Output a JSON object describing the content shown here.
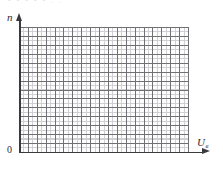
{
  "figure": {
    "title_fragment": "- - -  - -  . .",
    "background_color": "#ffffff",
    "axis_color": "#3a3a3e",
    "grid_major_color": "#6f6f74",
    "grid_minor_color": "#cfcfd4"
  },
  "axes": {
    "y_label": "n",
    "x_label": "U",
    "x_label_subscript": "в",
    "origin_label": "0",
    "y_arrow": "arrow-up",
    "x_arrow": "arrow-right"
  },
  "chart_data": {
    "type": "line",
    "title": "",
    "xlabel": "U",
    "ylabel": "n",
    "series": [],
    "x": [],
    "values": [],
    "grid": true,
    "grid_major_columns": 19,
    "grid_major_rows": 14,
    "grid_minor_subdivisions": 2,
    "legend": "none",
    "xlim": [
      0,
      19
    ],
    "ylim": [
      0,
      14
    ],
    "xticks": [],
    "yticks": [],
    "annotations": [],
    "note": "Empty graph-paper axes with no plotted data; grid only."
  }
}
